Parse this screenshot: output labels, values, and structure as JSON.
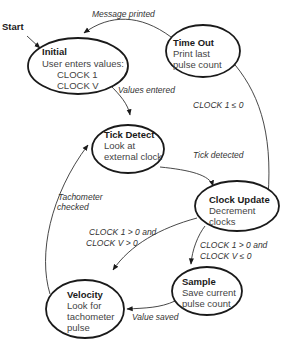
{
  "diagram": {
    "type": "state-machine",
    "start_label": "Start",
    "states": [
      {
        "id": "initial",
        "title": "Initial",
        "lines": [
          "User enters values:",
          "CLOCK 1",
          "CLOCK V"
        ]
      },
      {
        "id": "time_out",
        "title": "Time Out",
        "lines": [
          "Print last",
          "pulse count"
        ]
      },
      {
        "id": "tick_detect",
        "title": "Tick Detect",
        "lines": [
          "Look at",
          "external clock"
        ]
      },
      {
        "id": "clock_update",
        "title": "Clock Update",
        "lines": [
          "Decrement",
          "clocks"
        ]
      },
      {
        "id": "sample",
        "title": "Sample",
        "lines": [
          "Save current",
          "pulse count"
        ]
      },
      {
        "id": "velocity",
        "title": "Velocity",
        "lines": [
          "Look for",
          "tachometer",
          "pulse"
        ]
      }
    ],
    "transitions": [
      {
        "from": "start",
        "to": "initial",
        "label": ""
      },
      {
        "from": "time_out",
        "to": "initial",
        "label": "Message printed"
      },
      {
        "from": "initial",
        "to": "tick_detect",
        "label": "Values entered"
      },
      {
        "from": "tick_detect",
        "to": "clock_update",
        "label": "Tick detected"
      },
      {
        "from": "clock_update",
        "to": "time_out",
        "label": "CLOCK 1 ≤ 0"
      },
      {
        "from": "clock_update",
        "to": "velocity",
        "label_lines": [
          "CLOCK 1 > 0 and",
          "CLOCK V > 0"
        ]
      },
      {
        "from": "clock_update",
        "to": "sample",
        "label_lines": [
          "CLOCK 1 > 0 and",
          "CLOCK V ≤ 0"
        ]
      },
      {
        "from": "sample",
        "to": "velocity",
        "label": "Value saved"
      },
      {
        "from": "velocity",
        "to": "tick_detect",
        "label_lines": [
          "Tachometer",
          "checked"
        ]
      }
    ]
  }
}
